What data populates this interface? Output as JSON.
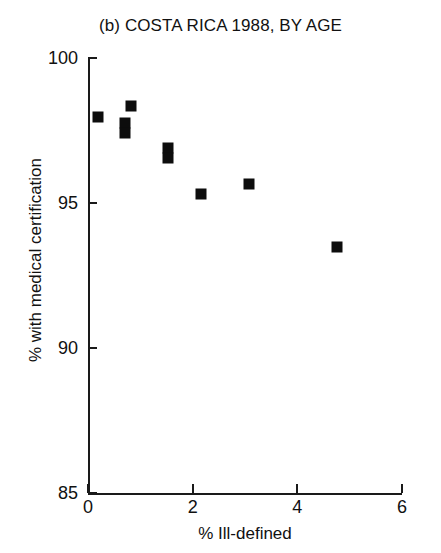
{
  "chart_data": {
    "type": "scatter",
    "title": "(b) COSTA RICA 1988, BY AGE",
    "xlabel": "% Ill-defined",
    "ylabel": "% with medical certification",
    "xlim": [
      0,
      6
    ],
    "ylim": [
      85,
      100
    ],
    "xticks": [
      "0",
      "2",
      "4",
      "6"
    ],
    "xtick_values": [
      0,
      2,
      4,
      6
    ],
    "yticks": [
      "85",
      "90",
      "95",
      "100"
    ],
    "ytick_values": [
      85,
      90,
      95,
      100
    ],
    "grid": false,
    "legend": null,
    "marker": "filled-square",
    "marker_color": "#0d0d0d",
    "x": [
      0.19,
      0.82,
      0.7,
      0.7,
      1.53,
      1.53,
      2.15,
      3.08,
      4.75
    ],
    "y": [
      97.95,
      98.35,
      97.75,
      97.4,
      96.9,
      96.55,
      95.3,
      95.65,
      93.5
    ],
    "points": [
      {
        "x": 0.19,
        "y": 97.95
      },
      {
        "x": 0.82,
        "y": 98.35
      },
      {
        "x": 0.7,
        "y": 97.75
      },
      {
        "x": 0.7,
        "y": 97.4
      },
      {
        "x": 1.53,
        "y": 96.9
      },
      {
        "x": 1.53,
        "y": 96.55
      },
      {
        "x": 2.15,
        "y": 95.3
      },
      {
        "x": 3.08,
        "y": 95.65
      },
      {
        "x": 4.75,
        "y": 93.5
      }
    ]
  }
}
